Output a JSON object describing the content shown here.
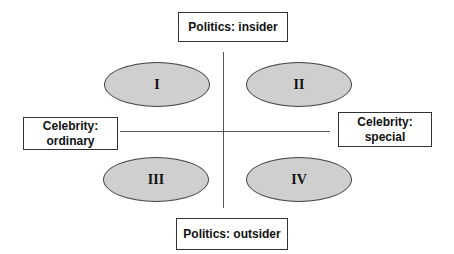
{
  "diagram": {
    "axes": {
      "top": {
        "label": "Politics: insider"
      },
      "bottom": {
        "label": "Politics: outsider"
      },
      "left": {
        "line1": "Celebrity:",
        "line2": "ordinary"
      },
      "right": {
        "line1": "Celebrity:",
        "line2": "special"
      }
    },
    "quadrants": [
      {
        "id": "I",
        "label": "I",
        "position": "top-left"
      },
      {
        "id": "II",
        "label": "II",
        "position": "top-right"
      },
      {
        "id": "III",
        "label": "III",
        "position": "bottom-left"
      },
      {
        "id": "IV",
        "label": "IV",
        "position": "bottom-right"
      }
    ],
    "colors": {
      "ellipse_fill": "#cfcfcf",
      "border": "#333333",
      "line": "#555555"
    }
  }
}
